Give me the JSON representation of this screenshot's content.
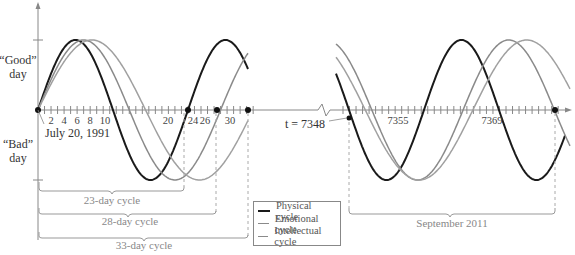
{
  "labels": {
    "good_day": [
      "“Good”",
      "day"
    ],
    "bad_day": [
      "“Bad”",
      "day"
    ],
    "start_date": "July 20, 1991",
    "t_marker": "t = 7348",
    "month_label": "September 2011"
  },
  "left_ticks": [
    "2",
    "4",
    "6",
    "8",
    "10",
    "20",
    "24",
    "26",
    "30"
  ],
  "right_ticks": [
    "7355",
    "7369"
  ],
  "brackets": [
    {
      "label": "23-day cycle",
      "days": 23
    },
    {
      "label": "28-day cycle",
      "days": 28
    },
    {
      "label": "33-day cycle",
      "days": 33
    }
  ],
  "legend": {
    "items": [
      {
        "label": "Physical cycle",
        "color": "#1a1a1a"
      },
      {
        "label": "Emotional cycle",
        "color": "#8a8a8a"
      },
      {
        "label": "Intellectual cycle",
        "color": "#8a8a8a"
      }
    ]
  },
  "colors": {
    "physical": "#1a1a1a",
    "emotional": "#8a8a8a",
    "intellectual": "#9a9a9a",
    "axis": "#888888",
    "bracket": "#999999"
  }
}
